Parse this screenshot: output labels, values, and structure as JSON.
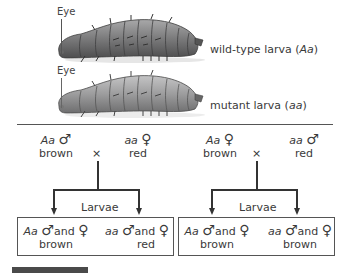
{
  "figure": {
    "larvae": [
      {
        "eye_label": "Eye",
        "caption_prefix": "wild-type larva (",
        "genotype": "Aa",
        "caption_suffix": ")",
        "body_color": "#7f7f80"
      },
      {
        "eye_label": "Eye",
        "caption_prefix": "mutant larva (",
        "genotype": "aa",
        "caption_suffix": ")",
        "body_color": "#9c9c9d"
      }
    ],
    "crosses": [
      {
        "parent1": {
          "genotype": "Aa",
          "sex_symbol": "♂",
          "phenotype": "brown"
        },
        "cross_symbol": "×",
        "parent2": {
          "genotype": "aa",
          "sex_symbol": "♀",
          "phenotype": "red"
        },
        "offspring_label": "Larvae",
        "offspring": [
          {
            "genotype": "Aa",
            "male": "♂",
            "and": "and",
            "female": "♀",
            "phenotype": "brown"
          },
          {
            "genotype": "aa",
            "male": "♂",
            "and": "and",
            "female": "♀",
            "phenotype": "red"
          }
        ]
      },
      {
        "parent1": {
          "genotype": "Aa",
          "sex_symbol": "♀",
          "phenotype": "brown"
        },
        "cross_symbol": "×",
        "parent2": {
          "genotype": "aa",
          "sex_symbol": "♂",
          "phenotype": "red"
        },
        "offspring_label": "Larvae",
        "offspring": [
          {
            "genotype": "Aa",
            "male": "♂",
            "and": "and",
            "female": "♀",
            "phenotype": "brown"
          },
          {
            "genotype": "aa",
            "male": "♂",
            "and": "and",
            "female": "♀",
            "phenotype": "brown"
          }
        ]
      }
    ]
  }
}
